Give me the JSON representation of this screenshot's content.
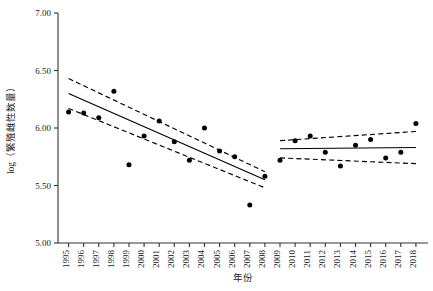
{
  "chart_data": {
    "type": "scatter",
    "title": "",
    "xlabel": "年份",
    "ylabel": "log（繁殖雌性数量）",
    "xlim": [
      1994.3,
      2018.8
    ],
    "ylim": [
      5.0,
      7.0
    ],
    "yticks": [
      5.0,
      5.5,
      6.0,
      6.5,
      7.0
    ],
    "ytick_labels": [
      "5.00",
      "5.50",
      "6.00",
      "6.50",
      "7.00"
    ],
    "xticks": [
      1995,
      1996,
      1997,
      1998,
      1999,
      2000,
      2001,
      2002,
      2003,
      2004,
      2005,
      2006,
      2007,
      2008,
      2009,
      2010,
      2011,
      2012,
      2013,
      2014,
      2015,
      2016,
      2017,
      2018
    ],
    "xtick_labels": [
      "1995",
      "1996",
      "1997",
      "1998",
      "1999",
      "2000",
      "2001",
      "2002",
      "2003",
      "2004",
      "2005",
      "2006",
      "2007",
      "2008",
      "2009",
      "2010",
      "2011",
      "2012",
      "2013",
      "2014",
      "2015",
      "2016",
      "2017",
      "2018"
    ],
    "grid": false,
    "legend": null,
    "marker": "filled-circle",
    "marker_color": "#000000",
    "line_color": "#000000",
    "ci_style": "dashed",
    "series": [
      {
        "name": "1995-2008 观测值",
        "type": "scatter",
        "x": [
          1995,
          1996,
          1997,
          1998,
          1999,
          2000,
          2001,
          2002,
          2003,
          2004,
          2005,
          2006,
          2007,
          2008
        ],
        "y": [
          6.14,
          6.13,
          6.09,
          6.32,
          5.68,
          5.93,
          6.06,
          5.88,
          5.72,
          6.0,
          5.8,
          5.75,
          5.33,
          5.58
        ]
      },
      {
        "name": "2009-2018 观测值",
        "type": "scatter",
        "x": [
          2009,
          2010,
          2011,
          2012,
          2013,
          2014,
          2015,
          2016,
          2017,
          2018
        ],
        "y": [
          5.72,
          5.89,
          5.93,
          5.79,
          5.67,
          5.85,
          5.9,
          5.74,
          5.79,
          6.04
        ]
      },
      {
        "name": "1995-2008 回归线",
        "type": "line",
        "x": [
          1995,
          2008
        ],
        "y": [
          6.3,
          5.55
        ]
      },
      {
        "name": "1995-2008 置信上限",
        "type": "dashed-line",
        "x": [
          1995,
          2008
        ],
        "y": [
          6.43,
          5.62
        ]
      },
      {
        "name": "1995-2008 置信下限",
        "type": "dashed-line",
        "x": [
          1995,
          2008
        ],
        "y": [
          6.17,
          5.48
        ]
      },
      {
        "name": "2009-2018 回归线",
        "type": "line",
        "x": [
          2009,
          2018
        ],
        "y": [
          5.82,
          5.83
        ]
      },
      {
        "name": "2009-2018 置信上限",
        "type": "dashed-line",
        "x": [
          2009,
          2018
        ],
        "y": [
          5.89,
          5.97
        ]
      },
      {
        "name": "2009-2018 置信下限",
        "type": "dashed-line",
        "x": [
          2009,
          2018
        ],
        "y": [
          5.74,
          5.69
        ]
      }
    ]
  },
  "axes": {
    "x_title": "年份",
    "y_title": "log（繁殖雌性数量）"
  },
  "colors": {
    "axis": "#333333",
    "marker": "#000000",
    "trend": "#000000",
    "background": "#ffffff"
  }
}
